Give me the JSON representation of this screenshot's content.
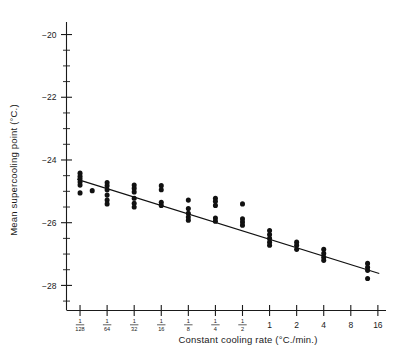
{
  "chart_data": {
    "type": "scatter",
    "title": "",
    "xlabel": "Constant cooling rate (°C./min.)",
    "ylabel": "Mean supercooling point (°C.)",
    "xscale": "log2",
    "xlim": [
      -7.5,
      4.3
    ],
    "ylim": [
      -28.8,
      -19.6
    ],
    "grid": false,
    "legend": null,
    "x_tick_labels": [
      {
        "value": -7,
        "label": "1/128",
        "num": "1",
        "den": "128"
      },
      {
        "value": -6,
        "label": "1/64",
        "num": "1",
        "den": "64"
      },
      {
        "value": -5,
        "label": "1/32",
        "num": "1",
        "den": "32"
      },
      {
        "value": -4,
        "label": "1/16",
        "num": "1",
        "den": "16"
      },
      {
        "value": -3,
        "label": "1/8",
        "num": "1",
        "den": "8"
      },
      {
        "value": -2,
        "label": "1/4",
        "num": "1",
        "den": "4"
      },
      {
        "value": -1,
        "label": "1/2",
        "num": "1",
        "den": "2"
      },
      {
        "value": 0,
        "label": "1",
        "num": "",
        "den": ""
      },
      {
        "value": 1,
        "label": "2",
        "num": "",
        "den": ""
      },
      {
        "value": 2,
        "label": "4",
        "num": "",
        "den": ""
      },
      {
        "value": 3,
        "label": "8",
        "num": "",
        "den": ""
      },
      {
        "value": 4,
        "label": "16",
        "num": "",
        "den": ""
      }
    ],
    "y_tick_labels": [
      {
        "value": -20,
        "label": "−20"
      },
      {
        "value": -22,
        "label": "−22"
      },
      {
        "value": -24,
        "label": "−24"
      },
      {
        "value": -26,
        "label": "−26"
      },
      {
        "value": -28,
        "label": "−28"
      }
    ],
    "y_minor_ticks": [
      -20.5,
      -21,
      -21.5,
      -22.5,
      -23,
      -23.5,
      -24.5,
      -25,
      -25.5,
      -26.5,
      -27,
      -27.5,
      -28.5
    ],
    "series": [
      {
        "name": "Mean supercooling point observations",
        "marker": "filled-circle",
        "color": "#111111",
        "points": [
          {
            "x": -7,
            "y": -24.42
          },
          {
            "x": -7,
            "y": -24.52
          },
          {
            "x": -7,
            "y": -24.6
          },
          {
            "x": -7,
            "y": -24.7
          },
          {
            "x": -7,
            "y": -24.8
          },
          {
            "x": -7,
            "y": -25.05
          },
          {
            "x": -6.55,
            "y": -24.98
          },
          {
            "x": -6,
            "y": -24.72
          },
          {
            "x": -6,
            "y": -24.82
          },
          {
            "x": -6,
            "y": -24.95
          },
          {
            "x": -6,
            "y": -25.12
          },
          {
            "x": -6,
            "y": -25.28
          },
          {
            "x": -6,
            "y": -25.4
          },
          {
            "x": -5,
            "y": -24.8
          },
          {
            "x": -5,
            "y": -24.9
          },
          {
            "x": -5,
            "y": -25.02
          },
          {
            "x": -5,
            "y": -25.22
          },
          {
            "x": -5,
            "y": -25.38
          },
          {
            "x": -5,
            "y": -25.5
          },
          {
            "x": -4,
            "y": -24.82
          },
          {
            "x": -4,
            "y": -24.95
          },
          {
            "x": -4,
            "y": -25.35
          },
          {
            "x": -4,
            "y": -25.45
          },
          {
            "x": -3,
            "y": -25.28
          },
          {
            "x": -3,
            "y": -25.55
          },
          {
            "x": -3,
            "y": -25.7
          },
          {
            "x": -3,
            "y": -25.82
          },
          {
            "x": -3,
            "y": -25.92
          },
          {
            "x": -2,
            "y": -25.22
          },
          {
            "x": -2,
            "y": -25.32
          },
          {
            "x": -2,
            "y": -25.45
          },
          {
            "x": -2,
            "y": -25.85
          },
          {
            "x": -2,
            "y": -25.95
          },
          {
            "x": -1,
            "y": -25.4
          },
          {
            "x": -1,
            "y": -25.88
          },
          {
            "x": -1,
            "y": -25.98
          },
          {
            "x": -1,
            "y": -26.08
          },
          {
            "x": 0,
            "y": -26.25
          },
          {
            "x": 0,
            "y": -26.38
          },
          {
            "x": 0,
            "y": -26.5
          },
          {
            "x": 0,
            "y": -26.62
          },
          {
            "x": 0,
            "y": -26.72
          },
          {
            "x": 1,
            "y": -26.62
          },
          {
            "x": 1,
            "y": -26.72
          },
          {
            "x": 1,
            "y": -26.85
          },
          {
            "x": 2,
            "y": -26.85
          },
          {
            "x": 2,
            "y": -26.98
          },
          {
            "x": 2,
            "y": -27.1
          },
          {
            "x": 2,
            "y": -27.2
          },
          {
            "x": 3.62,
            "y": -27.3
          },
          {
            "x": 3.62,
            "y": -27.42
          },
          {
            "x": 3.62,
            "y": -27.52
          },
          {
            "x": 3.62,
            "y": -27.78
          }
        ]
      }
    ],
    "fit_line": {
      "name": "regression line",
      "color": "#111111",
      "x_start": -7.1,
      "y_start": -24.62,
      "x_end": 4.05,
      "y_end": -27.62
    }
  }
}
